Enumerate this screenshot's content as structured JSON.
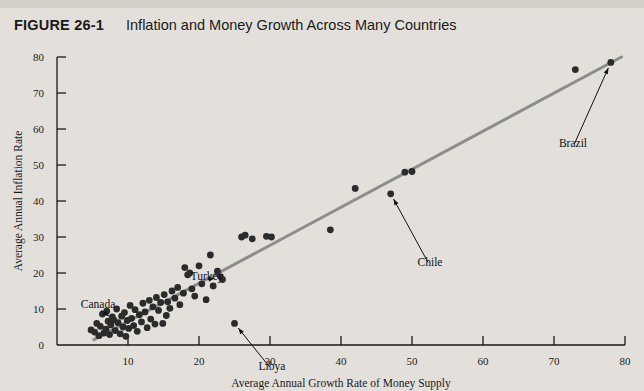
{
  "figure": {
    "number": "FIGURE 26-1",
    "title": "Inflation and Money Growth Across Many Countries"
  },
  "chart_data": {
    "type": "scatter",
    "title": "Inflation and Money Growth Across Many Countries",
    "xlabel": "Average Annual Growth Rate of Money Supply",
    "ylabel": "Average Annual Inflation Rate",
    "xlim": [
      0,
      80
    ],
    "ylim": [
      0,
      80
    ],
    "xticks": [
      0,
      10,
      20,
      30,
      40,
      50,
      60,
      70,
      80
    ],
    "yticks": [
      0,
      10,
      20,
      30,
      40,
      50,
      60,
      70,
      80
    ],
    "grid": false,
    "legend": null,
    "trendline": {
      "x": [
        5.2,
        79.5
      ],
      "y": [
        1.5,
        80.0
      ],
      "color": "#8d8d8d"
    },
    "point_color": "#2b2b2b",
    "points": [
      {
        "x": 4.8,
        "y": 4.2
      },
      {
        "x": 5.3,
        "y": 3.6
      },
      {
        "x": 5.6,
        "y": 6.0
      },
      {
        "x": 5.9,
        "y": 2.6
      },
      {
        "x": 6.1,
        "y": 5.2
      },
      {
        "x": 6.4,
        "y": 8.6
      },
      {
        "x": 6.6,
        "y": 3.3
      },
      {
        "x": 6.9,
        "y": 4.4
      },
      {
        "x": 7.0,
        "y": 9.4
      },
      {
        "x": 7.2,
        "y": 6.6
      },
      {
        "x": 7.4,
        "y": 2.9
      },
      {
        "x": 7.6,
        "y": 5.6
      },
      {
        "x": 7.8,
        "y": 7.8
      },
      {
        "x": 8.0,
        "y": 7.0
      },
      {
        "x": 8.2,
        "y": 4.0
      },
      {
        "x": 8.4,
        "y": 10.0
      },
      {
        "x": 8.6,
        "y": 6.2
      },
      {
        "x": 8.9,
        "y": 3.1
      },
      {
        "x": 9.1,
        "y": 8.0
      },
      {
        "x": 9.3,
        "y": 5.0
      },
      {
        "x": 9.5,
        "y": 9.0
      },
      {
        "x": 9.7,
        "y": 2.4
      },
      {
        "x": 9.9,
        "y": 6.8
      },
      {
        "x": 10.1,
        "y": 4.6
      },
      {
        "x": 10.3,
        "y": 11.0
      },
      {
        "x": 10.5,
        "y": 7.4
      },
      {
        "x": 10.8,
        "y": 5.4
      },
      {
        "x": 11.0,
        "y": 9.8
      },
      {
        "x": 11.3,
        "y": 3.8
      },
      {
        "x": 11.6,
        "y": 8.4
      },
      {
        "x": 11.9,
        "y": 6.4
      },
      {
        "x": 12.1,
        "y": 11.6
      },
      {
        "x": 12.4,
        "y": 9.2
      },
      {
        "x": 12.7,
        "y": 4.8
      },
      {
        "x": 13.0,
        "y": 12.4
      },
      {
        "x": 13.2,
        "y": 7.2
      },
      {
        "x": 13.5,
        "y": 10.6
      },
      {
        "x": 13.8,
        "y": 5.8
      },
      {
        "x": 14.0,
        "y": 13.2
      },
      {
        "x": 14.3,
        "y": 9.6
      },
      {
        "x": 14.6,
        "y": 11.8
      },
      {
        "x": 14.9,
        "y": 6.0
      },
      {
        "x": 15.1,
        "y": 14.0
      },
      {
        "x": 15.4,
        "y": 8.2
      },
      {
        "x": 15.6,
        "y": 12.0
      },
      {
        "x": 15.9,
        "y": 10.2
      },
      {
        "x": 16.2,
        "y": 15.0
      },
      {
        "x": 16.6,
        "y": 13.0
      },
      {
        "x": 17.0,
        "y": 16.0
      },
      {
        "x": 17.3,
        "y": 11.2
      },
      {
        "x": 17.8,
        "y": 14.4
      },
      {
        "x": 18.0,
        "y": 21.5
      },
      {
        "x": 18.4,
        "y": 19.5
      },
      {
        "x": 18.7,
        "y": 20.0
      },
      {
        "x": 19.0,
        "y": 15.6
      },
      {
        "x": 19.4,
        "y": 13.6
      },
      {
        "x": 20.0,
        "y": 22.0
      },
      {
        "x": 20.4,
        "y": 17.0
      },
      {
        "x": 21.0,
        "y": 12.6
      },
      {
        "x": 21.6,
        "y": 25.0
      },
      {
        "x": 22.0,
        "y": 16.4
      },
      {
        "x": 22.6,
        "y": 20.5
      },
      {
        "x": 23.0,
        "y": 19.0
      },
      {
        "x": 23.3,
        "y": 18.2
      },
      {
        "x": 25.0,
        "y": 6.0
      },
      {
        "x": 26.0,
        "y": 30.0
      },
      {
        "x": 26.5,
        "y": 30.5
      },
      {
        "x": 27.5,
        "y": 29.5
      },
      {
        "x": 29.5,
        "y": 30.2
      },
      {
        "x": 30.2,
        "y": 30.0
      },
      {
        "x": 38.5,
        "y": 32.0
      },
      {
        "x": 42.0,
        "y": 43.5
      },
      {
        "x": 47.0,
        "y": 42.0
      },
      {
        "x": 49.0,
        "y": 48.0
      },
      {
        "x": 50.0,
        "y": 48.2
      },
      {
        "x": 73.0,
        "y": 76.5
      },
      {
        "x": 78.0,
        "y": 78.5
      }
    ],
    "annotations": [
      {
        "label": "Canada",
        "label_x": 98,
        "label_y": 268,
        "point_x": 8.0,
        "point_y": 7.0
      },
      {
        "label": "Turkey",
        "label_x": 207,
        "label_y": 240,
        "point_x": 23.0,
        "point_y": 19.0
      },
      {
        "label": "Libya",
        "label_x": 272,
        "label_y": 330,
        "point_x": 25.0,
        "point_y": 6.0
      },
      {
        "label": "Chile",
        "label_x": 430,
        "label_y": 226,
        "point_x": 47.0,
        "point_y": 42.0
      },
      {
        "label": "Brazil",
        "label_x": 573,
        "label_y": 107,
        "point_x": 78.0,
        "point_y": 78.5
      }
    ]
  }
}
